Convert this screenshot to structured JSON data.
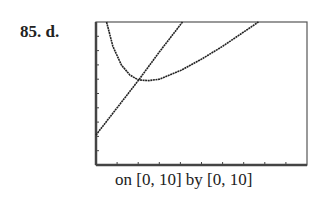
{
  "problem": {
    "label": "85. d."
  },
  "caption": "on [0, 10] by [0, 10]",
  "chart_data": {
    "type": "line",
    "title": "",
    "xlabel": "",
    "ylabel": "",
    "xlim": [
      0,
      10
    ],
    "ylim": [
      0,
      10
    ],
    "xticks": [
      0,
      1,
      2,
      3,
      4,
      5,
      6,
      7,
      8,
      9,
      10
    ],
    "yticks": [
      0,
      1,
      2,
      3,
      4,
      5,
      6,
      7,
      8,
      9,
      10
    ],
    "grid": false,
    "series": [
      {
        "name": "line",
        "x": [
          0,
          1,
          2,
          3,
          4.1
        ],
        "y": [
          2.1,
          4.0,
          5.9,
          7.9,
          10
        ]
      },
      {
        "name": "curve",
        "x": [
          0.5,
          0.8,
          1.2,
          1.6,
          2.0,
          2.5,
          3.0,
          4.0,
          5.0,
          6.0,
          7.0,
          7.7
        ],
        "y": [
          10,
          8.3,
          7.0,
          6.3,
          5.95,
          5.9,
          6.0,
          6.6,
          7.4,
          8.3,
          9.3,
          10
        ]
      }
    ]
  }
}
